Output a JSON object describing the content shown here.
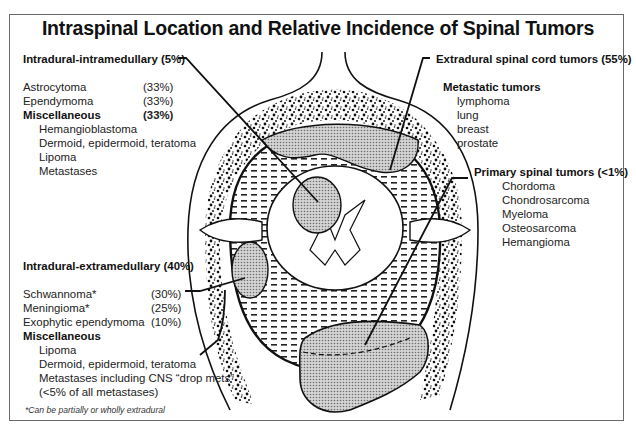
{
  "title": "Intraspinal Location and Relative Incidence of Spinal Tumors",
  "sections": {
    "intramedullary": {
      "heading": "Intradural-intramedullary (5%)",
      "items": [
        {
          "label": "Astrocytoma",
          "pct": "(33%)"
        },
        {
          "label": "Ependymoma",
          "pct": "(33%)"
        }
      ],
      "misc": {
        "label": "Miscellaneous",
        "pct": "(33%)"
      },
      "misc_items": [
        "Hemangioblastoma",
        "Dermoid, epidermoid, teratoma",
        "Lipoma",
        "Metastases"
      ]
    },
    "extramedullary": {
      "heading": "Intradural-extramedullary (40%)",
      "items": [
        {
          "label": "Schwannoma*",
          "pct": "(30%)"
        },
        {
          "label": "Meningioma*",
          "pct": "(25%)"
        },
        {
          "label": "Exophytic ependymoma",
          "pct": "(10%)"
        }
      ],
      "misc": {
        "label": "Miscellaneous"
      },
      "misc_items": [
        "Lipoma",
        "Dermoid, epidermoid, teratoma",
        "Metastases including CNS “drop mets”",
        "(<5% of all metastases)"
      ]
    },
    "extradural": {
      "heading": "Extradural spinal cord tumors (55%)",
      "metastatic": {
        "label": "Metastatic tumors",
        "items": [
          "lymphoma",
          "lung",
          "breast",
          "prostate"
        ]
      },
      "primary": {
        "label": "Primary spinal tumors (<1%)",
        "items": [
          "Chordoma",
          "Chondrosarcoma",
          "Myeloma",
          "Osteosarcoma",
          "Hemangioma"
        ]
      }
    }
  },
  "footnote": "*Can be partially or wholly extradural",
  "colors": {
    "frame": "#6a6a6a",
    "ink": "#111111",
    "tumor_fill": "#b8b8b8"
  }
}
